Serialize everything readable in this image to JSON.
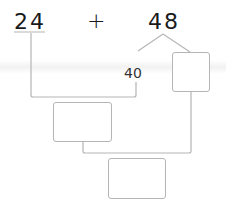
{
  "problem": {
    "left_operand": "24",
    "operator": "+",
    "right_operand": "48",
    "decomposition_tens": "40",
    "decomposition_ones_box": "",
    "partial_sum_box": "",
    "final_sum_box": ""
  },
  "colors": {
    "text": "#1a1a1a",
    "lines": "#b5b5b5",
    "box_border": "#b5b5b5"
  }
}
